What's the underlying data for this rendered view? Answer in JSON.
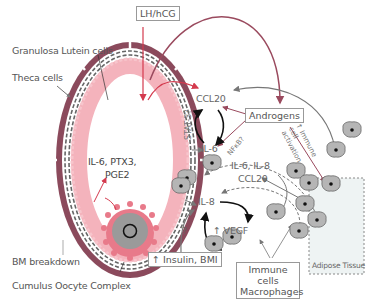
{
  "labels": {
    "lh_hcg": "LH/hCG",
    "granulosa": "Granulosa Lutein cells",
    "theca": "Theca cells",
    "ccl20": "CCL20",
    "androgens": "Androgens",
    "stat3": "STAT-3?",
    "nfkb": "NFκB?",
    "il6": "IL-6",
    "immune_activation": "↑ Immune cell activation",
    "il6_ptx3": "IL-6, PTX3,",
    "pge2": "PGE2",
    "il6_il8": "IL-6, IL-8",
    "ccl20_b": "CCL20",
    "il8": "IL-8",
    "vegf": "↑ VEGF",
    "question": "?",
    "insulin_bmi": "↑ Insulin, BMI",
    "bm_breakdown": "BM breakdown",
    "coc": "Cumulus Oocyte Complex",
    "immune_cells": "Immune cells",
    "macrophages": "Macrophages",
    "adipose": "Adipose Tissue"
  },
  "colors": {
    "theca": "#8b4a5c",
    "granulosa": "#f4b3bc",
    "cumulus": "#e87a8a",
    "oocyte": "#9a9a9a",
    "arrow_red": "#d43a4e",
    "arrow_mauve": "#9a4a5e",
    "cell_fill": "#b5b5b5",
    "adipose_fill": "#eef3f3"
  }
}
